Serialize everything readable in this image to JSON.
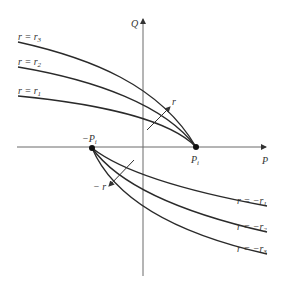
{
  "axes": {
    "x_label": "P",
    "y_label": "Q"
  },
  "points": {
    "positive": {
      "label": "P",
      "subscript": "i"
    },
    "negative": {
      "label": "−P",
      "subscript": "i"
    }
  },
  "upper_curves": [
    {
      "label_prefix": "r = r",
      "subscript": "3"
    },
    {
      "label_prefix": "r = r",
      "subscript": "2"
    },
    {
      "label_prefix": "r = r",
      "subscript": "1"
    }
  ],
  "lower_curves": [
    {
      "label_prefix": "r = −r",
      "subscript": "1"
    },
    {
      "label_prefix": "r = −r",
      "subscript": "2"
    },
    {
      "label_prefix": "r = −r",
      "subscript": "3"
    }
  ],
  "direction_arrows": {
    "upper": "r",
    "lower": "− r"
  },
  "colors": {
    "curve": "#2a2a2a",
    "axis": "#6a6a6a",
    "background": "#ffffff"
  }
}
